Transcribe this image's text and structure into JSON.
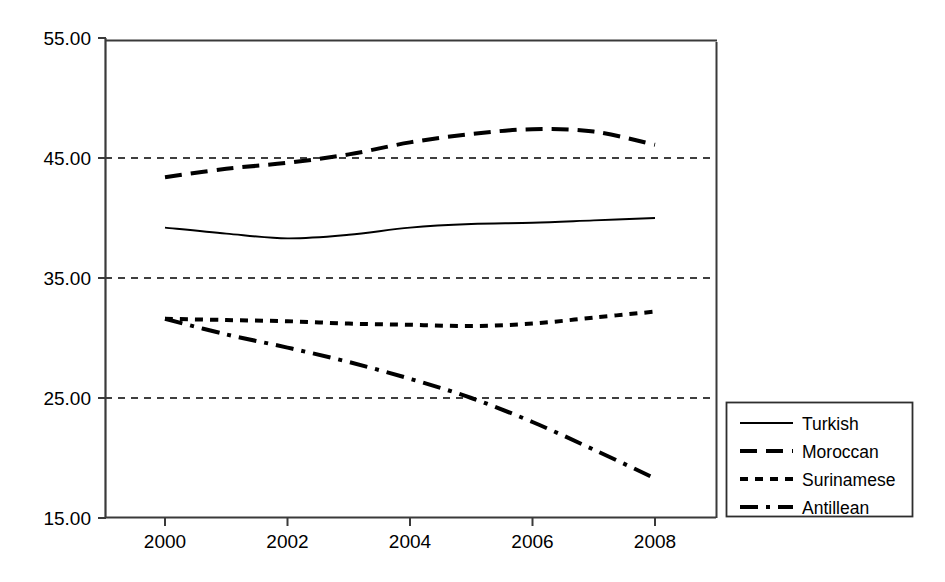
{
  "chart_data": {
    "type": "line",
    "title": "",
    "subtitle": "",
    "xlabel": "",
    "ylabel": "",
    "xlim": [
      1999.5,
      2008.75
    ],
    "ylim": [
      15.0,
      55.0
    ],
    "x_ticks": [
      2000,
      2002,
      2004,
      2006,
      2008
    ],
    "x_tick_labels": [
      "2000",
      "2002",
      "2004",
      "2006",
      "2008"
    ],
    "y_ticks": [
      15.0,
      25.0,
      35.0,
      45.0,
      55.0
    ],
    "y_tick_labels": [
      "15.00",
      "25.00",
      "35.00",
      "45.00",
      "55.00"
    ],
    "gridlines": {
      "horizontal": [
        25.0,
        35.0,
        45.0
      ],
      "vertical": [],
      "style": "dashed",
      "color": "#000000"
    },
    "legend": {
      "position": "right-outside",
      "entries": [
        "Turkish",
        "Moroccan",
        "Surinamese",
        "Antillean"
      ]
    },
    "x": [
      2000,
      2001,
      2002,
      2003,
      2004,
      2005,
      2006,
      2007,
      2008
    ],
    "series": [
      {
        "name": "Turkish",
        "dash": "solid",
        "color": "#000000",
        "values": [
          39.2,
          38.7,
          38.3,
          38.6,
          39.2,
          39.5,
          39.6,
          39.8,
          40.0
        ]
      },
      {
        "name": "Moroccan",
        "dash": "dashed",
        "color": "#000000",
        "values": [
          43.4,
          44.1,
          44.6,
          45.3,
          46.3,
          47.0,
          47.4,
          47.2,
          46.1
        ]
      },
      {
        "name": "Surinamese",
        "dash": "dotted",
        "color": "#000000",
        "values": [
          31.6,
          31.5,
          31.4,
          31.2,
          31.1,
          31.0,
          31.2,
          31.7,
          32.2
        ]
      },
      {
        "name": "Antillean",
        "dash": "dashdot",
        "color": "#000000",
        "values": [
          31.6,
          30.3,
          29.2,
          28.0,
          26.6,
          25.0,
          23.0,
          20.7,
          18.3
        ]
      }
    ]
  },
  "axes": {
    "y_labels": [
      "55.00",
      "45.00",
      "35.00",
      "25.00",
      "15.00"
    ],
    "x_labels": [
      "2000",
      "2002",
      "2004",
      "2006",
      "2008"
    ]
  },
  "legend": {
    "items": [
      {
        "label": "Turkish",
        "style": "solid"
      },
      {
        "label": "Moroccan",
        "style": "dashed"
      },
      {
        "label": "Surinamese",
        "style": "dotted"
      },
      {
        "label": "Antillean",
        "style": "dashdot"
      }
    ]
  },
  "colors": {
    "line": "#000000",
    "axis": "#3a3a3a",
    "grid": "#000000",
    "background": "#ffffff"
  }
}
